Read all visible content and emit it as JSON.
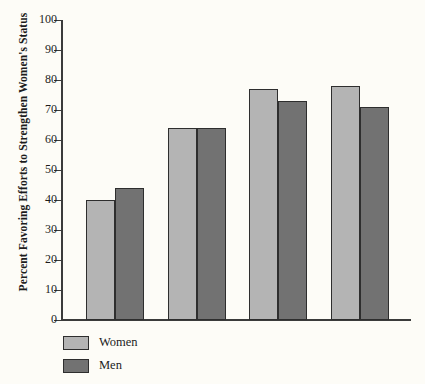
{
  "chart_data": {
    "type": "bar",
    "title": "",
    "subtitle": "",
    "xlabel": "",
    "ylabel": "Percent Favoring Efforts to Strengthen Women's Status",
    "ylim": [
      0,
      100
    ],
    "ytick_labels": [
      "100",
      "90",
      "80",
      "70",
      "60",
      "50",
      "40",
      "30",
      "20",
      "10",
      "0"
    ],
    "ytick_values": [
      100,
      90,
      80,
      70,
      60,
      50,
      40,
      30,
      20,
      10,
      0
    ],
    "xtick_labels": [
      "",
      "",
      "",
      ""
    ],
    "categories": [
      "",
      "",
      "",
      ""
    ],
    "grid": false,
    "legend_position": "bottom-left",
    "series": [
      {
        "name": "Women",
        "color": "#b4b4b4",
        "values": [
          40,
          64,
          77,
          78
        ]
      },
      {
        "name": "Men",
        "color": "#727272",
        "values": [
          44,
          64,
          73,
          71
        ]
      }
    ],
    "annotations": []
  },
  "legend": {
    "items": [
      {
        "label": "Women",
        "color": "#b4b4b4"
      },
      {
        "label": "Men",
        "color": "#727272"
      }
    ]
  },
  "colors": {
    "background": "#fdfcf7",
    "axis": "#3b3b3b",
    "bar_outline": "#2e2e2e",
    "text": "#1c1c1c",
    "women": "#b4b4b4",
    "men": "#727272"
  }
}
